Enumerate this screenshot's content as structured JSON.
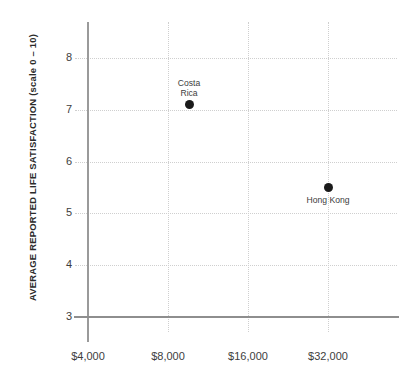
{
  "chart_data": {
    "type": "scatter",
    "title": "",
    "xlabel": "",
    "ylabel": "AVERAGE REPORTED LIFE SATISFACTION (scale 0 – 10)",
    "xscale": "log2",
    "xlim": [
      4000,
      45000
    ],
    "ylim": [
      3,
      8.7
    ],
    "grid": true,
    "legend": null,
    "x_ticks": [
      {
        "value": 4000,
        "label": "$4,000"
      },
      {
        "value": 8000,
        "label": "$8,000"
      },
      {
        "value": 16000,
        "label": "$16,000"
      },
      {
        "value": 32000,
        "label": "$32,000"
      }
    ],
    "y_ticks": [
      {
        "value": 8,
        "label": "8"
      },
      {
        "value": 7,
        "label": "7"
      },
      {
        "value": 6,
        "label": "6"
      },
      {
        "value": 5,
        "label": "5"
      },
      {
        "value": 4,
        "label": "4"
      },
      {
        "value": 3,
        "label": "3"
      }
    ],
    "points": [
      {
        "name": "Costa Rica",
        "label": "Costa\nRica",
        "label_position": "above",
        "x": 9600,
        "y": 7.1,
        "color": "#1a1a1a"
      },
      {
        "name": "Hong Kong",
        "label": "Hong Kong",
        "label_position": "below",
        "x": 32000,
        "y": 5.5,
        "color": "#1a1a1a"
      }
    ],
    "colors": {
      "point": "#1a1a1a",
      "gridline": "#cfcfcf",
      "axis": "#8e8e8e",
      "text": "#3d3d3d",
      "background": "#ffffff"
    }
  }
}
